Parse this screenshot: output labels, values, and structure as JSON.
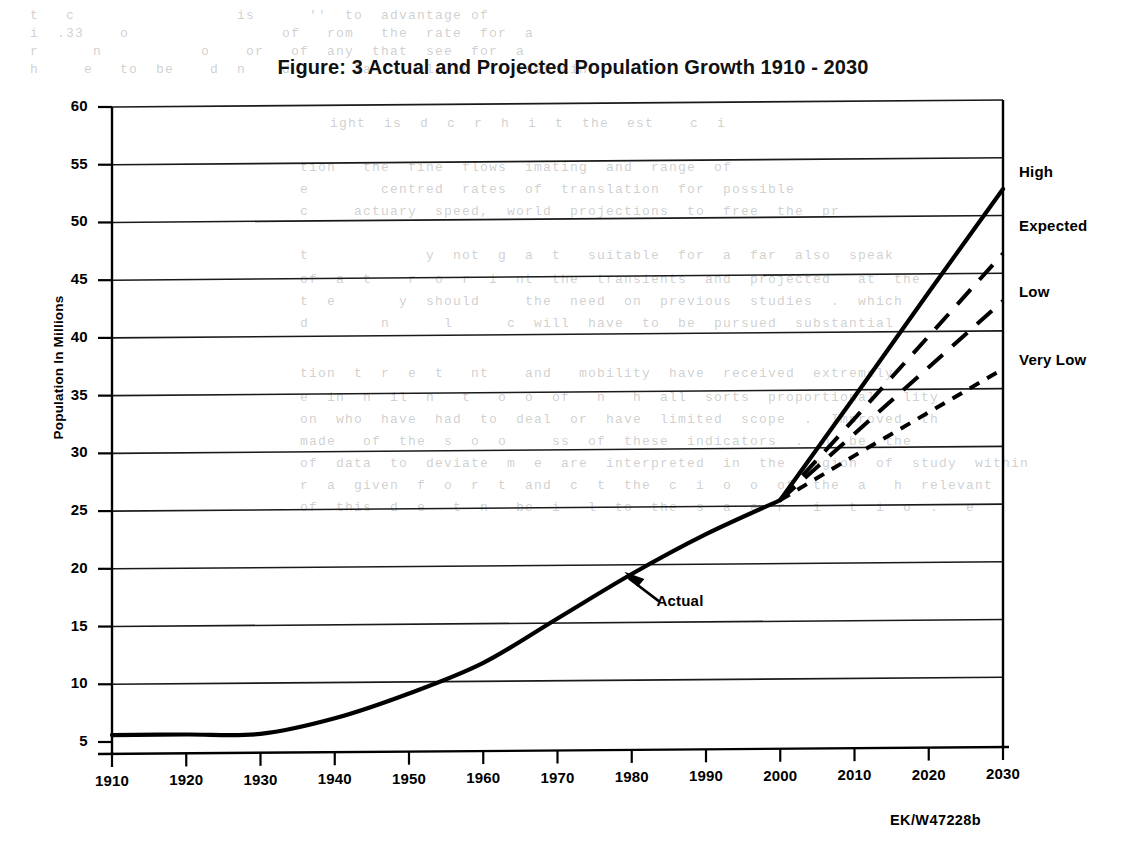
{
  "chart_data": {
    "type": "line",
    "title": "Figure: 3 Actual and Projected Population Growth 1910 - 2030",
    "xlabel": "",
    "ylabel": "Population In Millions",
    "xlim": [
      1910,
      2030
    ],
    "ylim": [
      5,
      60
    ],
    "ytick_step": 5,
    "xtick_step": 10,
    "grid": "horizontal",
    "legend_position": "right-inline-labels",
    "xticks": [
      "1910",
      "1920",
      "1930",
      "1940",
      "1950",
      "1960",
      "1970",
      "1980",
      "1990",
      "2000",
      "2010",
      "2020",
      "2030"
    ],
    "yticks": [
      "5",
      "10",
      "15",
      "20",
      "25",
      "30",
      "35",
      "40",
      "45",
      "50",
      "55",
      "60"
    ],
    "series": [
      {
        "name": "Actual",
        "style": "solid",
        "x": [
          1910,
          1920,
          1930,
          1940,
          1950,
          1960,
          1970,
          1980,
          1990,
          2000
        ],
        "values": [
          5.6,
          5.6,
          5.6,
          6.9,
          9.0,
          11.6,
          15.4,
          19.2,
          22.6,
          25.5
        ]
      },
      {
        "name": "High",
        "style": "solid",
        "x": [
          2000,
          2010,
          2020,
          2030
        ],
        "values": [
          25.5,
          34.4,
          43.4,
          52.3
        ]
      },
      {
        "name": "Expected",
        "style": "dashed-long",
        "x": [
          2000,
          2010,
          2020,
          2030
        ],
        "values": [
          25.5,
          32.5,
          39.6,
          46.7
        ]
      },
      {
        "name": "Low",
        "style": "dashed-long",
        "x": [
          2000,
          2010,
          2020,
          2030
        ],
        "values": [
          25.5,
          31.2,
          36.9,
          42.6
        ]
      },
      {
        "name": "Very Low",
        "style": "dashed-short",
        "x": [
          2000,
          2010,
          2020,
          2030
        ],
        "values": [
          25.5,
          29.3,
          33.0,
          36.7
        ]
      }
    ],
    "annotations": [
      {
        "text": "Actual",
        "x": 1982,
        "y": 17.0,
        "arrow_to_x": 1979,
        "arrow_to_y": 19.4
      }
    ],
    "series_labels": [
      {
        "text": "High",
        "value": 53.7
      },
      {
        "text": "Expected",
        "value": 49.0
      },
      {
        "text": "Low",
        "value": 43.3
      },
      {
        "text": "Very Low",
        "value": 37.4
      }
    ],
    "source_code": "EK/W47228b",
    "colors": {
      "ink": "#000000",
      "paper": "#ffffff",
      "grid": "#1a1a1a"
    }
  },
  "bleed_text": {
    "lines": [
      {
        "x": 30,
        "y": 8,
        "text": "t   c                  is      ''  to  advantage of"
      },
      {
        "x": 30,
        "y": 26,
        "text": "i  .33    o                 of   rom   the  rate  for  a"
      },
      {
        "x": 30,
        "y": 44,
        "text": "r      n           o    or   of  any  that  see  for  a"
      },
      {
        "x": 30,
        "y": 62,
        "text": "h     e   to  be    d  n    d       la      l  in  t  restraint"
      },
      {
        "x": 330,
        "y": 116,
        "text": "ight  is  d  c  r  h  i  t  the  est    c  i"
      },
      {
        "x": 300,
        "y": 160,
        "text": "tion   the  fine  flows  imating  and  range  of"
      },
      {
        "x": 300,
        "y": 182,
        "text": "e        centred  rates  of  translation  for  possible"
      },
      {
        "x": 300,
        "y": 204,
        "text": "c     actuary  speed,  world  projections  to  free  the  pr"
      },
      {
        "x": 300,
        "y": 248,
        "text": "t             y  not  g  a  t   suitable  for  a  far  also  speak"
      },
      {
        "x": 300,
        "y": 272,
        "text": "of  a  t    r  o  r  i  nt  the  transients  and  projected   at  the"
      },
      {
        "x": 300,
        "y": 294,
        "text": "t  e       y  should     the  need  on  previous  studies  .  which"
      },
      {
        "x": 300,
        "y": 316,
        "text": "d        n      l      c  will  have  to  be  pursued  substantial"
      },
      {
        "x": 300,
        "y": 366,
        "text": "tion  t  r  e  t   nt    and   mobility  have  received  extremely"
      },
      {
        "x": 300,
        "y": 390,
        "text": "e  in  n  il  n   t   o  o  of   n   h  all  sorts  proportional   lity"
      },
      {
        "x": 300,
        "y": 412,
        "text": "on  who  have  had  to  deal  or  have  limited  scope  .  Improved  th"
      },
      {
        "x": 300,
        "y": 434,
        "text": "made   of  the  s  o  o     ss  of  these  indicators  .  h  be  the"
      },
      {
        "x": 300,
        "y": 456,
        "text": "of  data  to  deviate  m  e  are  interpreted  in  the  region  of  study  within"
      },
      {
        "x": 300,
        "y": 478,
        "text": "r  a  given  f  o  r  t  and  c  t  the  c  i  o  o  of  the  a   h  relevant"
      },
      {
        "x": 300,
        "y": 500,
        "text": "of  this  d  e   t  n   be  i   l  to  the  s  a  e  r   i   t  i  o  .   e"
      }
    ]
  }
}
